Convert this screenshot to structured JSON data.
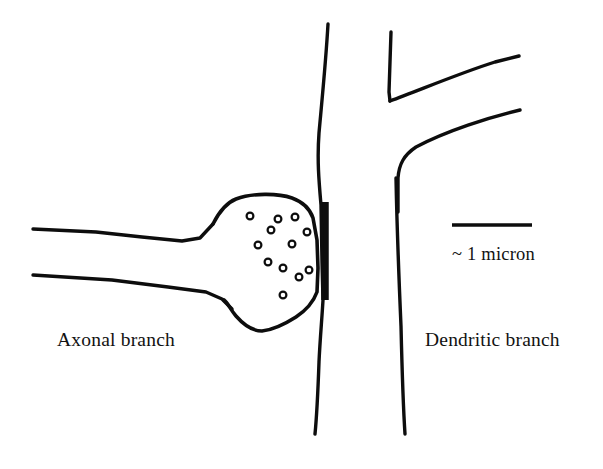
{
  "figure": {
    "background_color": "#ffffff",
    "ink_color": "#0d0d0d",
    "width": 603,
    "height": 469
  },
  "labels": {
    "axonal_branch": "Axonal branch",
    "dendritic_branch": "Dendritic branch",
    "scale_caption": "~ 1 micron"
  },
  "scale_bar": {
    "caption": "~ 1 micron",
    "x_start": 452,
    "x_end": 532,
    "y": 225,
    "length_px": 80
  },
  "structures": {
    "axon_upper_membrane": "M 33 229 L 96 232 L 142 237 L 182 241 L 200 238 L 213 224",
    "axon_lower_membrane": "M 33 275 L 112 280 L 168 287 L 206 292 L 222 299 L 232 309",
    "bouton_outline": "M 213 224 C 218 214 226 203 236 199 C 252 193 278 193 292 198 C 303 202 310 209 313 218 L 317 240 L 318 268 L 317 292 C 313 303 305 311 296 317 C 285 324 272 330 262 331 C 252 331 243 324 236 316 C 230 309 228 303 224 300",
    "postsynaptic_density_bar": "M 325 202 L 325 300",
    "dendrite_left_membrane": "M 328 24 C 326 60 322 100 319 133 C 317 160 319 182 321 205 L 322 262 L 323 300 C 322 318 320 340 319 362 C 318 390 317 414 315 434",
    "dendrite_right_membrane": "M 396 178 C 397 230 399 280 401 326 C 402 368 403 404 405 434",
    "dendrite_branch_v_left_arm": "M 391 32 L 389 92 L 390 101",
    "dendrite_branch_v_right_arm": "M 390 101 C 420 90 460 73 495 62 L 519 56",
    "dendrite_branch_lower_curve": "M 398 212 L 398 178 C 399 164 404 155 416 147 C 446 131 490 117 520 110"
  },
  "vesicles": {
    "radius": 3.4,
    "count": 12,
    "positions": [
      {
        "x": 250,
        "y": 216
      },
      {
        "x": 278,
        "y": 219
      },
      {
        "x": 295,
        "y": 217
      },
      {
        "x": 307,
        "y": 232
      },
      {
        "x": 258,
        "y": 245
      },
      {
        "x": 292,
        "y": 244
      },
      {
        "x": 283,
        "y": 268
      },
      {
        "x": 309,
        "y": 270
      },
      {
        "x": 299,
        "y": 277
      },
      {
        "x": 283,
        "y": 295
      },
      {
        "x": 268,
        "y": 262
      },
      {
        "x": 271,
        "y": 230
      }
    ]
  }
}
